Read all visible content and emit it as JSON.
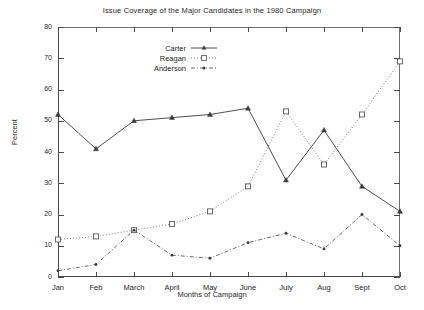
{
  "chart_data": {
    "type": "line",
    "title": "Issue Coverage of the Major Candidates in the 1980 Campaign",
    "xlabel": "Months of Campaign",
    "ylabel": "Percent",
    "categories": [
      "Jan",
      "Feb",
      "March",
      "April",
      "May",
      "June",
      "July",
      "Aug",
      "Sept",
      "Oct"
    ],
    "ylim": [
      0,
      80
    ],
    "yticks": [
      0,
      10,
      20,
      30,
      40,
      50,
      60,
      70,
      80
    ],
    "grid": false,
    "legend_position": "top-center",
    "series": [
      {
        "name": "Carter",
        "marker": "filled-triangle",
        "line": "solid",
        "values": [
          52,
          41,
          50,
          51,
          52,
          54,
          31,
          47,
          29,
          21
        ]
      },
      {
        "name": "Reagan",
        "marker": "open-square",
        "line": "dotted",
        "values": [
          12,
          13,
          15,
          17,
          21,
          29,
          53,
          36,
          52,
          69
        ]
      },
      {
        "name": "Anderson",
        "marker": "small-dot",
        "line": "dash-dot",
        "values": [
          2,
          4,
          15,
          7,
          6,
          11,
          14,
          9,
          20,
          10
        ]
      }
    ]
  },
  "colors": {
    "axis": "#4a4a4a",
    "carter": "#3a3a3a",
    "reagan": "#6b6b6b",
    "anderson": "#5a5a5a",
    "background": "#ffffff"
  }
}
